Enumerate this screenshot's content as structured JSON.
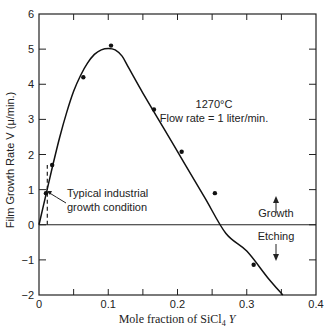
{
  "chart_data": {
    "type": "line",
    "title": "",
    "xlabel": "Mole fraction of SiCl",
    "xlabel_sub": "4",
    "xlabel_var": " Y",
    "ylabel": "Film Growth Rate  V (μ/min.)",
    "xlim": [
      0,
      0.4
    ],
    "ylim": [
      -2,
      6
    ],
    "x_ticks": [
      0,
      0.1,
      0.2,
      0.3,
      0.4
    ],
    "x_tick_labels": [
      "0",
      "0.1",
      "0.2",
      "0.3",
      "0.4"
    ],
    "x_minor_ticks": [
      0.05,
      0.15,
      0.25,
      0.35
    ],
    "y_ticks": [
      -2,
      -1,
      0,
      1,
      2,
      3,
      4,
      5,
      6
    ],
    "y_tick_labels": [
      "−2",
      "−1",
      "0",
      "1",
      "2",
      "3",
      "4",
      "5",
      "6"
    ],
    "grid": false,
    "series": [
      {
        "name": "measured points",
        "kind": "scatter",
        "x": [
          0.01,
          0.019,
          0.064,
          0.104,
          0.166,
          0.206,
          0.254,
          0.31
        ],
        "y": [
          0.9,
          1.7,
          4.2,
          5.1,
          3.28,
          2.08,
          0.9,
          -1.14
        ]
      },
      {
        "name": "fitted curve",
        "kind": "line",
        "x": [
          0.0,
          0.01,
          0.02,
          0.03,
          0.04,
          0.05,
          0.06,
          0.07,
          0.08,
          0.09,
          0.1,
          0.11,
          0.12,
          0.13,
          0.15,
          0.18,
          0.21,
          0.24,
          0.27,
          0.3,
          0.33,
          0.352
        ],
        "y": [
          0.0,
          0.85,
          1.7,
          2.5,
          3.2,
          3.8,
          4.25,
          4.6,
          4.85,
          4.98,
          5.02,
          4.98,
          4.8,
          4.45,
          3.75,
          2.75,
          1.75,
          0.75,
          -0.25,
          -0.75,
          -1.5,
          -2.0
        ]
      }
    ],
    "reference_lines": [
      {
        "orientation": "horizontal",
        "y": 0,
        "style": "solid"
      },
      {
        "orientation": "vertical",
        "x": 0.012,
        "y_range": [
          0,
          1.7
        ],
        "style": "dashed"
      }
    ],
    "annotations": [
      {
        "text": "1270°C",
        "x": 0.235,
        "y": 3.85
      },
      {
        "text": "Flow rate  =  1 liter/min.",
        "x": 0.235,
        "y": 3.4
      },
      {
        "text": "Typical industrial",
        "x": 0.03,
        "y": 0.95
      },
      {
        "text": "growth condition",
        "x": 0.03,
        "y": 0.55
      },
      {
        "text": "Growth",
        "x": 0.335,
        "y": 0.35,
        "arrow": "up"
      },
      {
        "text": "Etching",
        "x": 0.335,
        "y": -0.3,
        "arrow": "down"
      }
    ],
    "legend": null
  }
}
